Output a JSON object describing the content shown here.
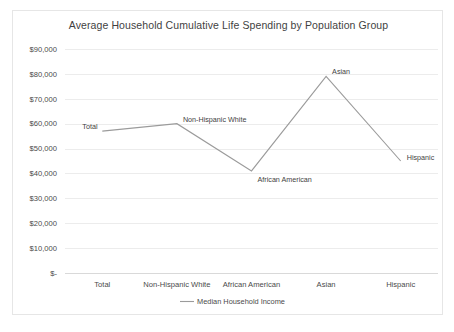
{
  "chart_data": {
    "type": "line",
    "title": "Average Household Cumulative Life Spending by Population Group",
    "xlabel": "",
    "ylabel": "",
    "categories": [
      "Total",
      "Non-Hispanic White",
      "African American",
      "Asian",
      "Hispanic"
    ],
    "series": [
      {
        "name": "Median Household Income",
        "values": [
          57000,
          60000,
          41000,
          79000,
          45000
        ],
        "color": "#9b9b9b",
        "point_labels": [
          "Total",
          "Non-Hispanic White",
          "African American",
          "Asian",
          "Hispanic"
        ]
      }
    ],
    "ylim": [
      0,
      90000
    ],
    "ytick_values": [
      0,
      10000,
      20000,
      30000,
      40000,
      50000,
      60000,
      70000,
      80000,
      90000
    ],
    "ytick_labels": [
      "$-",
      "$10,000",
      "$20,000",
      "$30,000",
      "$40,000",
      "$50,000",
      "$60,000",
      "$70,000",
      "$80,000",
      "$90,000"
    ],
    "grid": true,
    "grid_axis": "y",
    "legend": {
      "position": "bottom",
      "entries": [
        "Median Household Income"
      ]
    },
    "colors": {
      "line": "#9b9b9b",
      "grid": "#ececec",
      "axis": "#d9d9d9",
      "text": "#404040",
      "background": "#ffffff",
      "border": "#e6e6e6"
    }
  }
}
